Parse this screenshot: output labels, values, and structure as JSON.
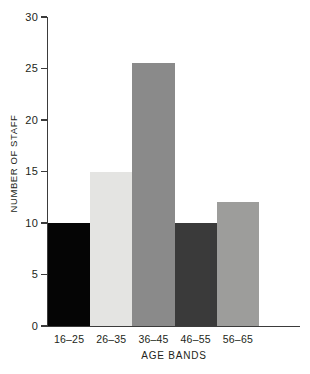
{
  "chart_data": {
    "type": "bar",
    "title": "",
    "xlabel": "AGE BANDS",
    "ylabel": "NUMBER OF STAFF",
    "categories": [
      "16–25",
      "26–35",
      "36–45",
      "46–55",
      "56–65"
    ],
    "values": [
      10,
      15,
      25.5,
      10,
      12
    ],
    "bar_colors": [
      "#050505",
      "#e4e4e2",
      "#8a8a8a",
      "#3a3a3a",
      "#9d9d9b"
    ],
    "ylim": [
      0,
      30
    ],
    "yticks": [
      0,
      5,
      10,
      15,
      20,
      25,
      30
    ],
    "ytick_labels": [
      "0",
      "5",
      "10",
      "15",
      "20",
      "25",
      "30"
    ],
    "grid": false,
    "legend": "none",
    "axis_color": "#3b3b3b",
    "background": "#ffffff"
  }
}
